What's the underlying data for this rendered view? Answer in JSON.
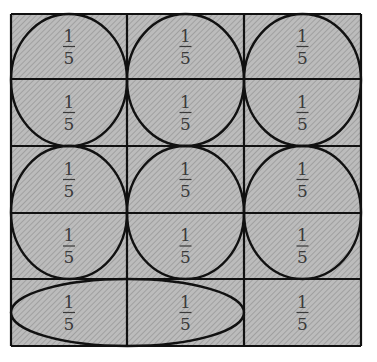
{
  "diagram": {
    "grid": {
      "rows": 5,
      "cols": 3,
      "x_lines": [
        11,
        127,
        244,
        361
      ],
      "y_lines": [
        14,
        79,
        146,
        213,
        279,
        346
      ],
      "fill_color": "#b8b8b8",
      "hatch_color": "#8f8f8f",
      "line_color": "#111111"
    },
    "cells": [
      {
        "row": 0,
        "col": 0,
        "numerator": "1",
        "denominator": "5"
      },
      {
        "row": 0,
        "col": 1,
        "numerator": "1",
        "denominator": "5"
      },
      {
        "row": 0,
        "col": 2,
        "numerator": "1",
        "denominator": "5"
      },
      {
        "row": 1,
        "col": 0,
        "numerator": "1",
        "denominator": "5"
      },
      {
        "row": 1,
        "col": 1,
        "numerator": "1",
        "denominator": "5"
      },
      {
        "row": 1,
        "col": 2,
        "numerator": "1",
        "denominator": "5"
      },
      {
        "row": 2,
        "col": 0,
        "numerator": "1",
        "denominator": "5"
      },
      {
        "row": 2,
        "col": 1,
        "numerator": "1",
        "denominator": "5"
      },
      {
        "row": 2,
        "col": 2,
        "numerator": "1",
        "denominator": "5"
      },
      {
        "row": 3,
        "col": 0,
        "numerator": "1",
        "denominator": "5"
      },
      {
        "row": 3,
        "col": 1,
        "numerator": "1",
        "denominator": "5"
      },
      {
        "row": 3,
        "col": 2,
        "numerator": "1",
        "denominator": "5"
      },
      {
        "row": 4,
        "col": 0,
        "numerator": "1",
        "denominator": "5"
      },
      {
        "row": 4,
        "col": 1,
        "numerator": "1",
        "denominator": "5"
      },
      {
        "row": 4,
        "col": 2,
        "numerator": "1",
        "denominator": "5"
      }
    ],
    "groupings": [
      {
        "shape": "circle",
        "cells": [
          [
            0,
            0
          ],
          [
            1,
            0
          ]
        ]
      },
      {
        "shape": "circle",
        "cells": [
          [
            0,
            1
          ],
          [
            1,
            1
          ]
        ]
      },
      {
        "shape": "circle",
        "cells": [
          [
            0,
            2
          ],
          [
            1,
            2
          ]
        ]
      },
      {
        "shape": "circle",
        "cells": [
          [
            2,
            0
          ],
          [
            3,
            0
          ]
        ]
      },
      {
        "shape": "circle",
        "cells": [
          [
            2,
            1
          ],
          [
            3,
            1
          ]
        ]
      },
      {
        "shape": "circle",
        "cells": [
          [
            2,
            2
          ],
          [
            3,
            2
          ]
        ]
      },
      {
        "shape": "ellipse",
        "cells": [
          [
            4,
            0
          ],
          [
            4,
            1
          ]
        ]
      }
    ]
  }
}
